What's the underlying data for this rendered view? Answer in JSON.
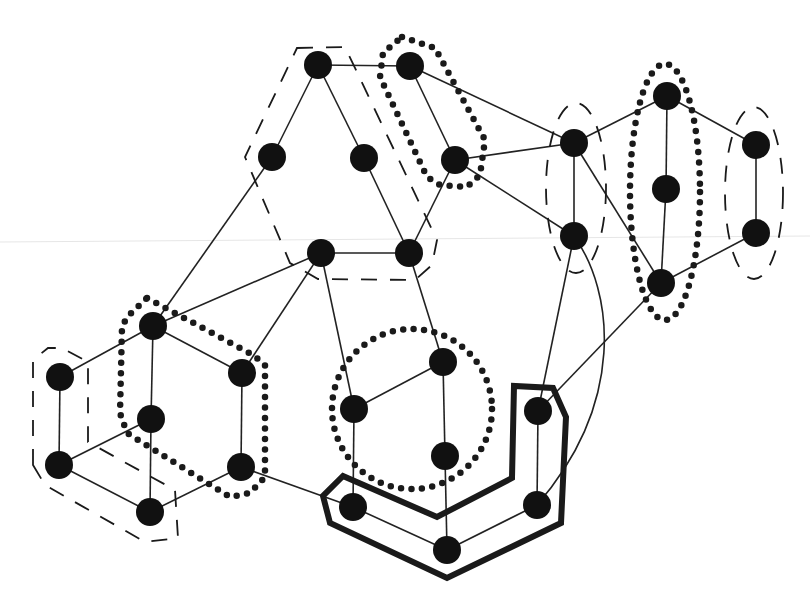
{
  "diagram": {
    "width": 810,
    "height": 600,
    "node_radius": 14,
    "colors": {
      "background": "#ffffff",
      "node": "#111111",
      "edge": "#222222",
      "outline": "#1a1a1a"
    },
    "nodes": [
      {
        "id": "A",
        "x": 318,
        "y": 65
      },
      {
        "id": "B",
        "x": 410,
        "y": 66
      },
      {
        "id": "C",
        "x": 272,
        "y": 157
      },
      {
        "id": "D",
        "x": 364,
        "y": 158
      },
      {
        "id": "E",
        "x": 455,
        "y": 160
      },
      {
        "id": "F",
        "x": 321,
        "y": 253
      },
      {
        "id": "G",
        "x": 409,
        "y": 253
      },
      {
        "id": "H",
        "x": 574,
        "y": 143
      },
      {
        "id": "I",
        "x": 574,
        "y": 236
      },
      {
        "id": "J",
        "x": 667,
        "y": 96
      },
      {
        "id": "K",
        "x": 666,
        "y": 189
      },
      {
        "id": "L",
        "x": 661,
        "y": 283
      },
      {
        "id": "M",
        "x": 756,
        "y": 145
      },
      {
        "id": "N",
        "x": 756,
        "y": 233
      },
      {
        "id": "O",
        "x": 153,
        "y": 326
      },
      {
        "id": "P",
        "x": 60,
        "y": 377
      },
      {
        "id": "Q",
        "x": 242,
        "y": 373
      },
      {
        "id": "R",
        "x": 151,
        "y": 419
      },
      {
        "id": "S",
        "x": 59,
        "y": 465
      },
      {
        "id": "T",
        "x": 241,
        "y": 467
      },
      {
        "id": "U",
        "x": 150,
        "y": 512
      },
      {
        "id": "V",
        "x": 443,
        "y": 362
      },
      {
        "id": "W",
        "x": 354,
        "y": 409
      },
      {
        "id": "X",
        "x": 445,
        "y": 456
      },
      {
        "id": "Y",
        "x": 538,
        "y": 411
      },
      {
        "id": "Z",
        "x": 353,
        "y": 507
      },
      {
        "id": "AA",
        "x": 447,
        "y": 550
      },
      {
        "id": "AB",
        "x": 537,
        "y": 505
      }
    ],
    "edges": [
      [
        "A",
        "B"
      ],
      [
        "A",
        "C"
      ],
      [
        "A",
        "D"
      ],
      [
        "D",
        "G"
      ],
      [
        "B",
        "E"
      ],
      [
        "E",
        "G"
      ],
      [
        "F",
        "G"
      ],
      [
        "B",
        "H"
      ],
      [
        "E",
        "H"
      ],
      [
        "E",
        "I"
      ],
      [
        "H",
        "I"
      ],
      [
        "H",
        "J"
      ],
      [
        "H",
        "L"
      ],
      [
        "J",
        "K"
      ],
      [
        "K",
        "L"
      ],
      [
        "J",
        "M"
      ],
      [
        "M",
        "N"
      ],
      [
        "L",
        "N"
      ],
      [
        "L",
        "Y"
      ],
      [
        "I",
        "Y"
      ],
      [
        "C",
        "O"
      ],
      [
        "O",
        "F"
      ],
      [
        "Q",
        "F"
      ],
      [
        "O",
        "P"
      ],
      [
        "O",
        "Q"
      ],
      [
        "O",
        "R"
      ],
      [
        "R",
        "U"
      ],
      [
        "P",
        "S"
      ],
      [
        "S",
        "R"
      ],
      [
        "S",
        "U"
      ],
      [
        "Q",
        "T"
      ],
      [
        "T",
        "U"
      ],
      [
        "T",
        "Z"
      ],
      [
        "F",
        "W"
      ],
      [
        "G",
        "V"
      ],
      [
        "W",
        "V"
      ],
      [
        "V",
        "X"
      ],
      [
        "W",
        "Z"
      ],
      [
        "X",
        "AA"
      ],
      [
        "Z",
        "AA"
      ],
      [
        "AA",
        "AB"
      ],
      [
        "Y",
        "AB"
      ]
    ],
    "curved_edges": [
      {
        "from": "I",
        "to": "AB",
        "path": "M574,236 C614,292 626,402 537,505"
      }
    ],
    "groups": [
      {
        "id": "group-acdfg",
        "style": "dashed",
        "shape": "polygon",
        "points": "297,48 345,47 437,240 432,265 415,280 318,279 290,263 245,157",
        "members": [
          "A",
          "C",
          "D",
          "F",
          "G"
        ]
      },
      {
        "id": "group-be",
        "style": "dotted",
        "shape": "polygon",
        "points": "402,37 435,48 485,140 480,175 467,187 440,185 427,177 380,77 383,53",
        "members": [
          "B",
          "E"
        ]
      },
      {
        "id": "group-hi",
        "style": "dashed",
        "shape": "ellipse",
        "cx": 576,
        "cy": 188,
        "rx": 30,
        "ry": 85,
        "members": [
          "H",
          "I"
        ]
      },
      {
        "id": "group-jkl",
        "style": "dotted",
        "shape": "ellipse",
        "cx": 665,
        "cy": 192,
        "rx": 35,
        "ry": 128,
        "members": [
          "J",
          "K",
          "L"
        ]
      },
      {
        "id": "group-mn",
        "style": "dashed",
        "shape": "ellipse",
        "cx": 754,
        "cy": 193,
        "rx": 29,
        "ry": 86,
        "members": [
          "M",
          "N"
        ]
      },
      {
        "id": "group-psu",
        "style": "dashed",
        "shape": "polygon",
        "points": "33,465 33,360 48,348 62,348 88,362 88,442 175,490 178,538 145,542 45,485",
        "members": [
          "P",
          "S",
          "U"
        ]
      },
      {
        "id": "group-oqrt",
        "style": "dotted",
        "shape": "polygon",
        "points": "147,298 253,355 265,365 265,477 250,493 230,497 127,433 120,413 122,327 127,317",
        "members": [
          "O",
          "Q",
          "R",
          "T"
        ]
      },
      {
        "id": "group-vwx",
        "style": "dotted",
        "shape": "circle",
        "cx": 412,
        "cy": 409,
        "r": 80,
        "members": [
          "V",
          "W",
          "X"
        ]
      },
      {
        "id": "group-yzaaab",
        "style": "thick",
        "shape": "polygon",
        "points": "343,476 437,517 512,478 514,386 553,388 566,417 561,523 447,578 330,523 323,496",
        "members": [
          "Y",
          "Z",
          "AA",
          "AB"
        ]
      }
    ]
  }
}
